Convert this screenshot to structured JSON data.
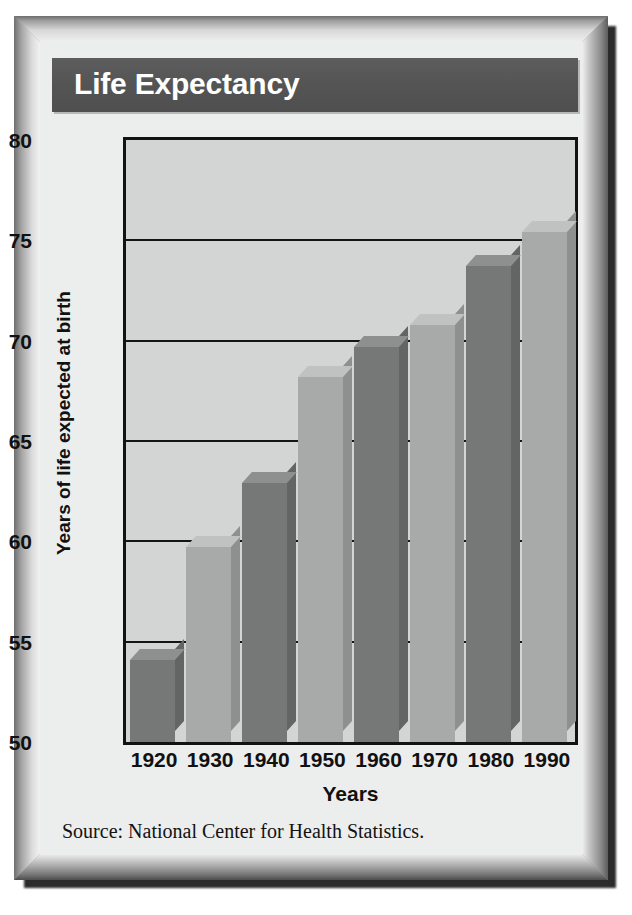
{
  "figure": {
    "title": "Life Expectancy",
    "source": "Source:  National Center for Health Statistics.",
    "colors": {
      "banner_bg": "#565656",
      "banner_text": "#ffffff",
      "plot_bg": "#d3d4d4",
      "axis": "#121212",
      "bar_light": "#a8a9a9",
      "bar_dark": "#767777",
      "frame": "#9a9a9a",
      "card_bg": "#eceded"
    }
  },
  "chart_data": {
    "type": "bar",
    "title": "Life Expectancy",
    "xlabel": "Years",
    "ylabel": "Years of life expected at birth",
    "categories": [
      "1920",
      "1930",
      "1940",
      "1950",
      "1960",
      "1970",
      "1980",
      "1990"
    ],
    "values": [
      54.1,
      59.7,
      62.9,
      68.2,
      69.7,
      70.8,
      73.7,
      75.4
    ],
    "ylim": [
      50,
      80
    ],
    "yticks": [
      "50",
      "55",
      "60",
      "65",
      "70",
      "75",
      "80"
    ],
    "ytick_values": [
      50,
      55,
      60,
      65,
      70,
      75,
      80
    ],
    "grid": true,
    "legend": "none",
    "bar_style": "3d-extruded",
    "bar_shades": [
      "dark",
      "light",
      "dark",
      "light",
      "dark",
      "light",
      "dark",
      "light"
    ]
  }
}
